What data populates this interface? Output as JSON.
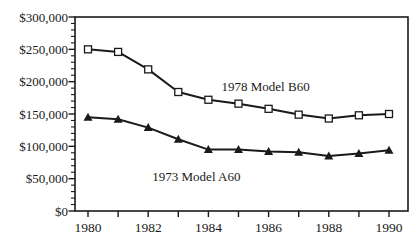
{
  "title": "Beech Duke Resale Value",
  "chart_data": {
    "type": "line",
    "title": "Beech Duke Resale Value",
    "x": [
      1980,
      1981,
      1982,
      1983,
      1984,
      1985,
      1986,
      1987,
      1988,
      1989,
      1990
    ],
    "x_tick_labels": [
      "1980",
      "1982",
      "1984",
      "1986",
      "1988",
      "1990"
    ],
    "x_labeled_years": [
      1980,
      1982,
      1984,
      1986,
      1988,
      1990
    ],
    "y_tick_labels": [
      "$0",
      "$50,000",
      "$100,000",
      "$150,000",
      "$200,000",
      "$250,000",
      "$300,000"
    ],
    "ylim": [
      0,
      300000
    ],
    "y_major_step": 50000,
    "y_minor_step": 10000,
    "grid": false,
    "legend_position": "inline-annotations",
    "series": [
      {
        "name": "1978 Model B60",
        "marker": "hollow-square",
        "values": [
          250000,
          246000,
          219000,
          184000,
          172000,
          166000,
          158000,
          149000,
          143000,
          148000,
          150000
        ]
      },
      {
        "name": "1973 Model A60",
        "marker": "filled-triangle",
        "values": [
          145000,
          142000,
          129000,
          111000,
          95000,
          95000,
          92000,
          91000,
          85000,
          89000,
          94000
        ]
      }
    ],
    "annotations": [
      {
        "text": "1978 Model B60",
        "x": 1985.9,
        "y": 192000
      },
      {
        "text": "1973 Model A60",
        "x": 1983.6,
        "y": 52000
      }
    ],
    "colors": {
      "line": "#1a1a1a",
      "frame": "#1a1a1a",
      "marker_fill_square": "#ffffff",
      "background": "#ffffff"
    }
  }
}
